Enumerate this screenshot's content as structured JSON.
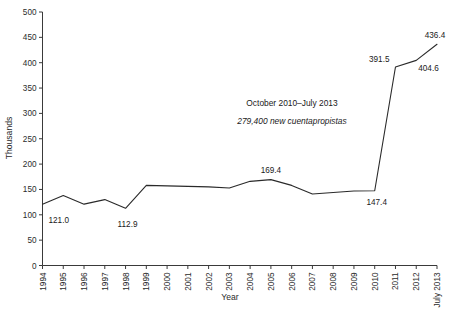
{
  "chart_data": {
    "type": "line",
    "title": "",
    "xlabel": "Year",
    "ylabel": "Thousands",
    "ylim": [
      0,
      500
    ],
    "ytick_step": 50,
    "grid": false,
    "legend": "none",
    "line_color": "#2a2a2a",
    "categories": [
      "1994",
      "1995",
      "1996",
      "1997",
      "1998",
      "1999",
      "2000",
      "2001",
      "2002",
      "2003",
      "2004",
      "2005",
      "2006",
      "2007",
      "2008",
      "2009",
      "2010",
      "2011",
      "2012",
      "July 2013"
    ],
    "values": [
      121.0,
      138.0,
      121.0,
      130.0,
      112.9,
      158.0,
      157.0,
      156.0,
      155.0,
      153.0,
      166.0,
      169.4,
      158.0,
      141.0,
      144.0,
      147.0,
      147.4,
      391.5,
      404.6,
      436.4
    ],
    "ytick_labels": [
      "0",
      "50",
      "100",
      "150",
      "200",
      "250",
      "300",
      "350",
      "400",
      "450",
      "500"
    ],
    "point_labels": [
      {
        "category": "1994",
        "value": 121.0,
        "text": "121.0"
      },
      {
        "category": "1998",
        "value": 112.9,
        "text": "112.9"
      },
      {
        "category": "2005",
        "value": 169.4,
        "text": "169.4"
      },
      {
        "category": "2010",
        "value": 147.4,
        "text": "147.4"
      },
      {
        "category": "2011",
        "value": 391.5,
        "text": "391.5"
      },
      {
        "category": "2012",
        "value": 404.6,
        "text": "404.6"
      },
      {
        "category": "July 2013",
        "value": 436.4,
        "text": "436.4"
      }
    ],
    "annotations": [
      {
        "text": "October 2010–July 2013",
        "style": "normal"
      },
      {
        "text": "279,400 new cuentapropistas",
        "style": "italic"
      }
    ]
  }
}
